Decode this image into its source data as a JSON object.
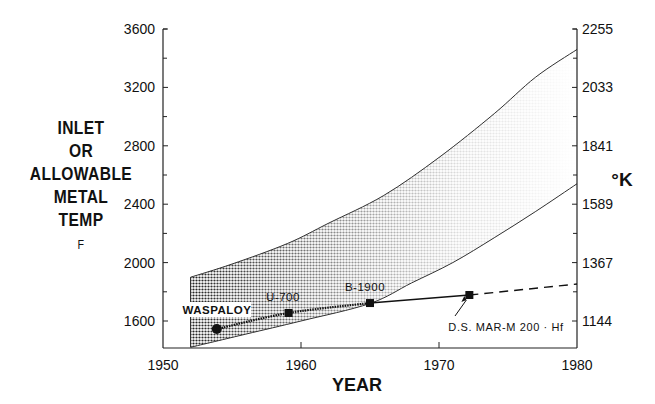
{
  "chart_data": {
    "type": "line",
    "title": "",
    "xlabel": "YEAR",
    "ylabel_left": [
      "INLET",
      "OR",
      "ALLOWABLE",
      "METAL",
      "TEMP",
      "F"
    ],
    "ylabel_right": "°K",
    "xlim": [
      1950,
      1980
    ],
    "ylim_left": [
      1415,
      3600
    ],
    "x_ticks": [
      1950,
      1960,
      1970,
      1980
    ],
    "y_ticks_left": [
      1600,
      2000,
      2400,
      2800,
      3200,
      3600
    ],
    "y_ticks_right": [
      {
        "label": "1144",
        "f": 1600
      },
      {
        "label": "1367",
        "f": 2000
      },
      {
        "label": "1589",
        "f": 2400
      },
      {
        "label": "1841",
        "f": 2800
      },
      {
        "label": "2033",
        "f": 3200
      },
      {
        "label": "2255",
        "f": 3600
      }
    ],
    "grid": false,
    "band": {
      "name": "Inlet temperature range (shaded)",
      "upper": [
        [
          1952,
          1900
        ],
        [
          1955,
          1990
        ],
        [
          1959,
          2130
        ],
        [
          1962,
          2270
        ],
        [
          1966,
          2460
        ],
        [
          1970,
          2720
        ],
        [
          1974,
          3020
        ],
        [
          1977,
          3270
        ],
        [
          1980,
          3460
        ]
      ],
      "lower": [
        [
          1952,
          1420
        ],
        [
          1956,
          1510
        ],
        [
          1960,
          1600
        ],
        [
          1965,
          1720
        ],
        [
          1968,
          1860
        ],
        [
          1971,
          2000
        ],
        [
          1974,
          2170
        ],
        [
          1977,
          2350
        ],
        [
          1980,
          2540
        ]
      ]
    },
    "series": [
      {
        "name": "Allowable metal temperature",
        "style": "solid",
        "points": [
          {
            "x": 1953.9,
            "y": 1545,
            "label": "WASPALOY"
          },
          {
            "x": 1959.1,
            "y": 1655,
            "label": "U-700"
          },
          {
            "x": 1965.0,
            "y": 1723,
            "label": "B-1900"
          },
          {
            "x": 1972.2,
            "y": 1778,
            "label": "D.S. MAR-M 200 · Hf"
          }
        ]
      },
      {
        "name": "Projected metal temperature",
        "style": "dashed",
        "points": [
          {
            "x": 1972.2,
            "y": 1778
          },
          {
            "x": 1980,
            "y": 1853
          }
        ]
      }
    ]
  },
  "labels": {
    "waspaloy": "WASPALOY",
    "u700": "U-700",
    "b1900": "B-1900",
    "marm": "D.S. MAR-M 200 · Hf"
  }
}
